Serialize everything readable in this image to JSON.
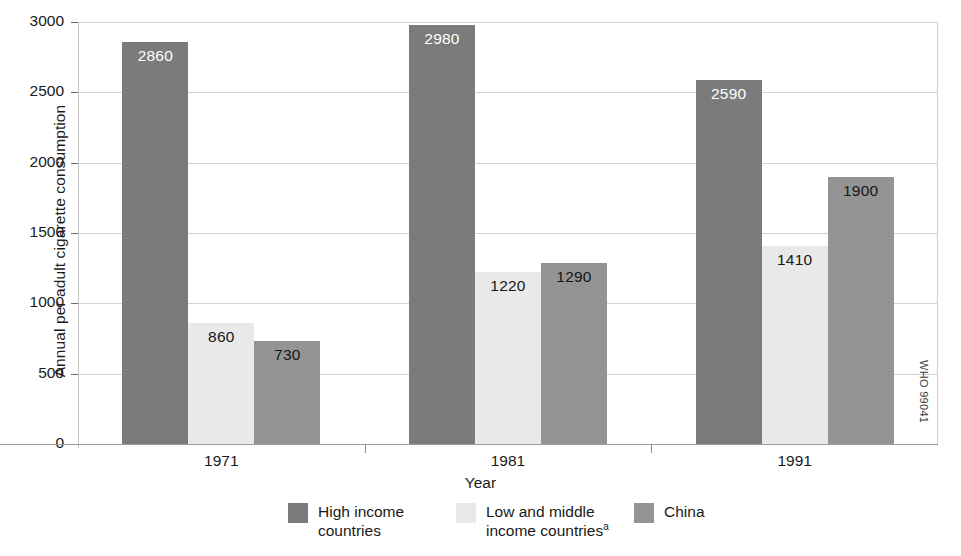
{
  "chart_data": {
    "type": "bar",
    "title": "",
    "subtitle": "",
    "xlabel": "Year",
    "ylabel": "Annual per adult cigarette consumption",
    "categories": [
      "1971",
      "1981",
      "1991"
    ],
    "ylim": [
      0,
      3000
    ],
    "yticks": [
      0,
      500,
      1000,
      1500,
      2000,
      2500,
      3000
    ],
    "ytick_labels": [
      "0",
      "500",
      "1000",
      "1500",
      "2000",
      "2500",
      "3000"
    ],
    "grid": true,
    "legend_position": "bottom",
    "series": [
      {
        "name": "High income countries",
        "legend_label_line1": "High income",
        "legend_label_line2": "countries",
        "color": "#7b7b7b",
        "label_color": "light",
        "values": [
          2860,
          2980,
          2590
        ],
        "value_labels": [
          "2860",
          "2980",
          "2590"
        ]
      },
      {
        "name": "Low and middle income countries",
        "legend_label_line1": "Low and middle",
        "legend_label_line2": "income countries",
        "legend_label_superscript": "a",
        "color": "#e9e9e9",
        "label_color": "dark",
        "values": [
          860,
          1220,
          1410
        ],
        "value_labels": [
          "860",
          "1220",
          "1410"
        ]
      },
      {
        "name": "China",
        "legend_label_line1": "China",
        "legend_label_line2": "",
        "color": "#949494",
        "label_color": "dark",
        "values": [
          730,
          1290,
          1900
        ],
        "value_labels": [
          "730",
          "1290",
          "1900"
        ]
      }
    ]
  },
  "credit": "WHO 99041"
}
